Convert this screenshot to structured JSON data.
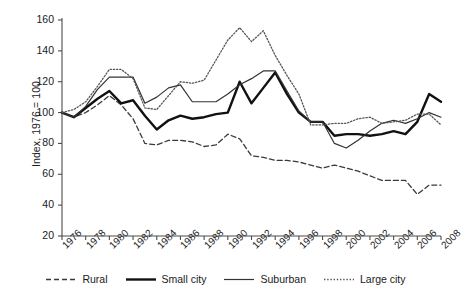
{
  "chart_data": {
    "type": "line",
    "title": "",
    "xlabel": "",
    "ylabel": "Index, 1976 = 100",
    "xlim": [
      1976,
      2008
    ],
    "ylim": [
      20,
      160
    ],
    "yticks": [
      20,
      40,
      60,
      80,
      100,
      120,
      140,
      160
    ],
    "xticks": [
      1976,
      1978,
      1980,
      1982,
      1984,
      1986,
      1988,
      1990,
      1992,
      1994,
      1996,
      1998,
      2000,
      2002,
      2004,
      2006,
      2008
    ],
    "grid": false,
    "legend_position": "bottom",
    "x": [
      1976,
      1977,
      1978,
      1979,
      1980,
      1981,
      1982,
      1983,
      1984,
      1985,
      1986,
      1987,
      1988,
      1989,
      1990,
      1991,
      1992,
      1993,
      1994,
      1995,
      1996,
      1997,
      1998,
      1999,
      2000,
      2001,
      2002,
      2003,
      2004,
      2005,
      2006,
      2007,
      2008
    ],
    "series": [
      {
        "name": "Rural",
        "style": "dashed",
        "color": "#3a3a3a",
        "width": 1.3,
        "values": [
          100,
          97,
          100,
          105,
          111,
          105,
          96,
          80,
          79,
          82,
          82,
          81,
          78,
          79,
          86,
          83,
          72,
          71,
          69,
          69,
          68,
          66,
          64,
          66,
          64,
          62,
          59,
          56,
          56,
          56,
          47,
          53,
          53
        ]
      },
      {
        "name": "Small city",
        "style": "solid-thick",
        "color": "#111111",
        "width": 2.4,
        "values": [
          100,
          97,
          103,
          109,
          114,
          106,
          108,
          98,
          89,
          95,
          98,
          96,
          97,
          99,
          100,
          120,
          106,
          116,
          126,
          112,
          100,
          94,
          94,
          85,
          86,
          86,
          85,
          86,
          88,
          86,
          94,
          112,
          107
        ]
      },
      {
        "name": "Suburban",
        "style": "solid-thin",
        "color": "#333333",
        "width": 1.2,
        "values": [
          100,
          97,
          104,
          115,
          123,
          123,
          123,
          106,
          110,
          116,
          118,
          107,
          107,
          107,
          112,
          118,
          122,
          127,
          127,
          114,
          101,
          94,
          94,
          80,
          77,
          82,
          88,
          93,
          95,
          93,
          96,
          100,
          97
        ]
      },
      {
        "name": "Large city",
        "style": "dotted",
        "color": "#555555",
        "width": 1.3,
        "values": [
          100,
          102,
          107,
          117,
          128,
          128,
          122,
          103,
          102,
          111,
          120,
          119,
          121,
          134,
          147,
          155,
          146,
          153,
          137,
          124,
          112,
          92,
          92,
          93,
          93,
          96,
          97,
          93,
          94,
          95,
          99,
          99,
          92
        ]
      }
    ]
  },
  "legend": {
    "items": [
      {
        "label": "Rural",
        "icon": "dashed-line-swatch"
      },
      {
        "label": "Small city",
        "icon": "thick-solid-line-swatch"
      },
      {
        "label": "Suburban",
        "icon": "thin-solid-line-swatch"
      },
      {
        "label": "Large city",
        "icon": "dotted-line-swatch"
      }
    ]
  }
}
